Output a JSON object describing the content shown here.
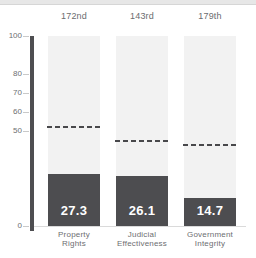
{
  "page": {
    "background_color": "#ffffff",
    "top_strip_color": "#e7e7e7"
  },
  "chart_data": {
    "type": "bar",
    "title": "",
    "categories": [
      "Property Rights",
      "Judicial Effectiveness",
      "Government Integrity"
    ],
    "category_label_lines": [
      [
        "Property",
        "Rights"
      ],
      [
        "Judicial",
        "Effectiveness"
      ],
      [
        "Government",
        "Integrity"
      ]
    ],
    "ranks": [
      "172nd",
      "143rd",
      "179th"
    ],
    "values": [
      27.3,
      26.1,
      14.7
    ],
    "value_labels": [
      "27.3",
      "26.1",
      "14.7"
    ],
    "world_average_dashed_lines": [
      52,
      45,
      42.5
    ],
    "ylim": [
      0,
      100
    ],
    "yticks": [
      100,
      80,
      70,
      60,
      50,
      0
    ],
    "grid": "off",
    "legend": "none",
    "colors": {
      "bar": "#4d4d50",
      "column_background": "#f2f2f2",
      "average_line": "#48484b",
      "axis_line": "#4e4e51",
      "tick_text": "#6d6e71",
      "category_text": "#6d6e71",
      "rank_text": "#6b6c6f",
      "value_text": "#ffffff",
      "baseline": "#dadada"
    }
  }
}
